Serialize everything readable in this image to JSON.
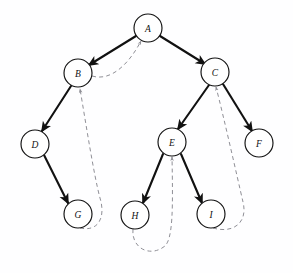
{
  "diagram": {
    "canvas": {
      "width": 293,
      "height": 273,
      "background": "#fefeff"
    },
    "style": {
      "tree_edge_color": "#111111",
      "back_edge_color": "#8f8f96",
      "node_stroke_color": "#111111",
      "node_fill_color": "#ffffff",
      "node_radius": 14
    },
    "nodes": [
      {
        "id": "A",
        "label": "A",
        "cx": 148,
        "cy": 28,
        "r": 14
      },
      {
        "id": "B",
        "label": "B",
        "cx": 78,
        "cy": 73,
        "r": 14
      },
      {
        "id": "C",
        "label": "C",
        "cx": 215,
        "cy": 72,
        "r": 14
      },
      {
        "id": "D",
        "label": "D",
        "cx": 35,
        "cy": 144,
        "r": 14
      },
      {
        "id": "E",
        "label": "E",
        "cx": 172,
        "cy": 142,
        "r": 14
      },
      {
        "id": "F",
        "label": "F",
        "cx": 259,
        "cy": 143,
        "r": 14
      },
      {
        "id": "G",
        "label": "G",
        "cx": 78,
        "cy": 214,
        "r": 14
      },
      {
        "id": "H",
        "label": "H",
        "cx": 135,
        "cy": 215,
        "r": 14
      },
      {
        "id": "I",
        "label": "I",
        "cx": 211,
        "cy": 214,
        "r": 14
      }
    ],
    "tree_edges": [
      {
        "from": "A",
        "to": "B"
      },
      {
        "from": "A",
        "to": "C"
      },
      {
        "from": "B",
        "to": "D"
      },
      {
        "from": "C",
        "to": "E"
      },
      {
        "from": "C",
        "to": "F"
      },
      {
        "from": "D",
        "to": "G"
      },
      {
        "from": "E",
        "to": "H"
      },
      {
        "from": "E",
        "to": "I"
      }
    ],
    "back_edges": [
      {
        "from": "B",
        "to": "A"
      },
      {
        "from": "G",
        "to": "B"
      },
      {
        "from": "H",
        "to": "E"
      },
      {
        "from": "I",
        "to": "C"
      }
    ]
  }
}
